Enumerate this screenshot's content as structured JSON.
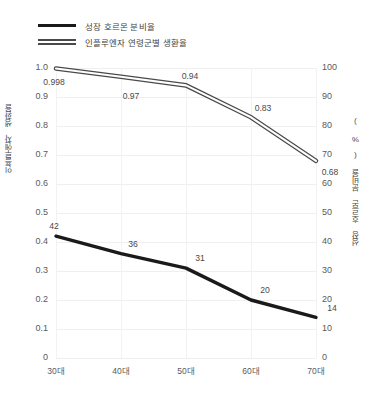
{
  "legend": {
    "items": [
      {
        "label": "성장 호르몬 분비율",
        "style": "solid",
        "color": "#1a1a1a"
      },
      {
        "label": "인플루엔자 연령군별 생환율",
        "style": "double",
        "color": "#4a4a4a"
      }
    ]
  },
  "axes": {
    "left_title": "인플루엔자 생환율",
    "right_title": "성장 호르몬 분비율 ( % )",
    "left_ticks": [
      "1.0",
      "0.9",
      "0.8",
      "0.7",
      "0.6",
      "0.5",
      "0.4",
      "0.3",
      "0.2",
      "0.1",
      "0"
    ],
    "right_ticks": [
      "100",
      "90",
      "80",
      "70",
      "60",
      "50",
      "40",
      "30",
      "20",
      "10",
      "0"
    ],
    "x_ticks": [
      "30대",
      "40대",
      "50대",
      "60대",
      "70대"
    ]
  },
  "chart_data": {
    "type": "line",
    "title": "",
    "xlabel": "",
    "ylabel": "인플루엔자 생환율",
    "y2label": "성장 호르몬 분비율 ( % )",
    "categories": [
      "30대",
      "40대",
      "50대",
      "60대",
      "70대"
    ],
    "ylim": [
      0,
      1.0
    ],
    "y2lim": [
      0,
      100
    ],
    "grid": true,
    "legend_position": "top-left",
    "series": [
      {
        "name": "인플루엔자 연령군별 생환율",
        "axis": "left",
        "style": "double",
        "color": "#4a4a4a",
        "values": [
          0.998,
          0.97,
          0.94,
          0.83,
          0.68
        ],
        "labels": [
          "0.998",
          "0.97",
          "0.94",
          "0.83",
          "0.68"
        ]
      },
      {
        "name": "성장 호르몬 분비율",
        "axis": "right",
        "style": "solid",
        "color": "#1a1a1a",
        "values": [
          42,
          36,
          31,
          20,
          14
        ],
        "labels": [
          "42",
          "36",
          "31",
          "20",
          "14"
        ]
      }
    ]
  }
}
